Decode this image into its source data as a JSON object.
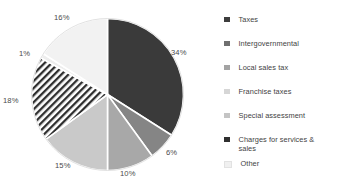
{
  "chart_data": {
    "type": "pie",
    "title": "",
    "categories": [
      "Taxes",
      "Intergovernmental",
      "Local sales tax",
      "Franchise taxes",
      "Special assessment",
      "Charges for services & sales",
      "Other"
    ],
    "values": [
      34,
      6,
      10,
      15,
      18,
      1,
      16
    ],
    "data_labels": [
      "34%",
      "6%",
      "10%",
      "15%",
      "18%",
      "1%",
      "16%"
    ],
    "slice_colors": [
      "#3a3a3a",
      "#858585",
      "#a8a8a8",
      "#c9c9c9",
      "#ffffff",
      "#ededed",
      "#f2f2f2"
    ],
    "slice_patterns": [
      "solid",
      "solid",
      "solid",
      "solid",
      "diagonal-hatch",
      "solid",
      "solid"
    ],
    "legend_swatch_colors": [
      "#3d3d3d",
      "#6f6f6f",
      "#a3a3a3",
      "#d6d6d6",
      "#c4c4c4",
      "#2f2f2f",
      "#f0f0f0"
    ],
    "start_angle": 0,
    "direction": "clockwise",
    "legend_position": "right",
    "grid": false,
    "separator_color": "#ffffff"
  },
  "legend": {
    "items": [
      {
        "label": "Taxes"
      },
      {
        "label": "Intergovernmental"
      },
      {
        "label": "Local sales tax"
      },
      {
        "label": "Franchise taxes"
      },
      {
        "label": "Special assessment"
      },
      {
        "label": "Charges for services &\nsales"
      },
      {
        "label": "Other"
      }
    ]
  },
  "pie_labels": [
    {
      "text": "34%",
      "left": 171,
      "top": 48
    },
    {
      "text": "6%",
      "left": 166,
      "top": 148
    },
    {
      "text": "10%",
      "left": 120,
      "top": 169
    },
    {
      "text": "15%",
      "left": 55,
      "top": 161
    },
    {
      "text": "18%",
      "left": 3,
      "top": 96
    },
    {
      "text": "1%",
      "left": 19,
      "top": 49
    },
    {
      "text": "16%",
      "left": 54,
      "top": 13
    }
  ]
}
